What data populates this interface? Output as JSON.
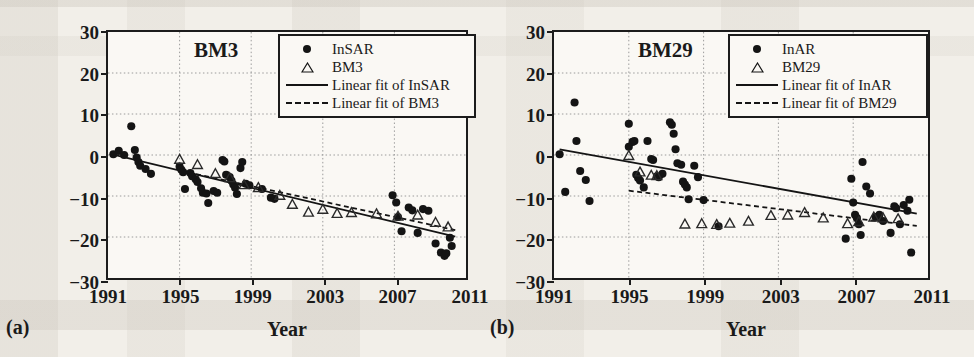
{
  "figure": {
    "background_color": "#f2efe9",
    "plot_background_color": "#faf8f4",
    "ink_color": "#1a1a1a",
    "grid_color": "#9a9a9a"
  },
  "panels": [
    {
      "tag": "(a)",
      "title": "BM3",
      "xlabel": "Year",
      "ylabel": "Deformation (mm)",
      "legend": [
        {
          "key": "circle",
          "label": "InSAR"
        },
        {
          "key": "triangle",
          "label": "BM3"
        },
        {
          "key": "solid-line",
          "label": "Linear fit of InSAR"
        },
        {
          "key": "dashed-line",
          "label": "Linear fit of BM3"
        }
      ]
    },
    {
      "tag": "(b)",
      "title": "BM29",
      "xlabel": "Year",
      "ylabel": "Deformation (mm)",
      "legend": [
        {
          "key": "circle",
          "label": "InAR"
        },
        {
          "key": "triangle",
          "label": "BM29"
        },
        {
          "key": "solid-line",
          "label": "Linear fit of InAR"
        },
        {
          "key": "dashed-line",
          "label": "Linear fit of BM29"
        }
      ]
    }
  ],
  "chart_data": [
    {
      "type": "scatter",
      "panel": "(a)",
      "title": "BM3",
      "xlabel": "Year",
      "ylabel": "Deformation (mm)",
      "xlim": [
        1991,
        2011
      ],
      "ylim": [
        -30,
        30
      ],
      "xticks": [
        1991,
        1995,
        1999,
        2003,
        2007,
        2011
      ],
      "yticks": [
        30,
        20,
        10,
        0,
        -10,
        -20,
        -30
      ],
      "grid": true,
      "grid_style": "dotted",
      "legend_position": "top-right",
      "series": [
        {
          "name": "InSAR",
          "marker": "filled-circle",
          "points": [
            [
              1991.3,
              0.2
            ],
            [
              1991.6,
              1.0
            ],
            [
              1991.9,
              0.0
            ],
            [
              1992.3,
              7.0
            ],
            [
              1992.5,
              1.2
            ],
            [
              1992.6,
              -0.6
            ],
            [
              1992.7,
              -1.7
            ],
            [
              1992.8,
              -2.6
            ],
            [
              1993.1,
              -3.4
            ],
            [
              1993.4,
              -4.6
            ],
            [
              1995.0,
              -2.8
            ],
            [
              1995.1,
              -3.6
            ],
            [
              1995.2,
              -4.2
            ],
            [
              1995.3,
              -8.3
            ],
            [
              1995.6,
              -4.4
            ],
            [
              1995.7,
              -5.2
            ],
            [
              1995.9,
              -5.9
            ],
            [
              1996.0,
              -6.6
            ],
            [
              1996.2,
              -8.1
            ],
            [
              1996.3,
              -9.2
            ],
            [
              1996.5,
              -9.4
            ],
            [
              1996.6,
              -11.7
            ],
            [
              1996.9,
              -8.8
            ],
            [
              1997.1,
              -9.2
            ],
            [
              1997.4,
              -1.2
            ],
            [
              1997.5,
              -1.6
            ],
            [
              1997.6,
              -4.8
            ],
            [
              1997.8,
              -5.4
            ],
            [
              1997.9,
              -6.3
            ],
            [
              1998.0,
              -7.2
            ],
            [
              1998.1,
              -8.0
            ],
            [
              1998.2,
              -9.5
            ],
            [
              1998.4,
              -3.2
            ],
            [
              1998.5,
              -1.7
            ],
            [
              1998.7,
              -7.0
            ],
            [
              1998.9,
              -7.4
            ],
            [
              1999.6,
              -8.3
            ],
            [
              2000.1,
              -10.4
            ],
            [
              2000.3,
              -10.7
            ],
            [
              2006.9,
              -9.8
            ],
            [
              2007.1,
              -11.6
            ],
            [
              2007.2,
              -15.1
            ],
            [
              2007.4,
              -18.6
            ],
            [
              2007.8,
              -12.8
            ],
            [
              2008.0,
              -13.5
            ],
            [
              2008.3,
              -19.0
            ],
            [
              2008.6,
              -13.2
            ],
            [
              2008.9,
              -13.6
            ],
            [
              2009.3,
              -21.6
            ],
            [
              2009.6,
              -23.8
            ],
            [
              2009.8,
              -24.6
            ],
            [
              2009.9,
              -24.0
            ],
            [
              2010.1,
              -20.2
            ],
            [
              2010.2,
              -22.2
            ]
          ]
        },
        {
          "name": "BM3",
          "marker": "open-triangle",
          "points": [
            [
              1995.0,
              -1.1
            ],
            [
              1996.0,
              -2.4
            ],
            [
              1997.0,
              -4.6
            ],
            [
              1997.8,
              -5.6
            ],
            [
              1998.6,
              -7.3
            ],
            [
              1999.4,
              -8.0
            ],
            [
              2000.6,
              -9.9
            ],
            [
              2001.3,
              -12.1
            ],
            [
              2002.2,
              -14.0
            ],
            [
              2003.0,
              -13.3
            ],
            [
              2003.8,
              -14.3
            ],
            [
              2004.6,
              -14.1
            ],
            [
              2006.0,
              -14.4
            ],
            [
              2007.2,
              -15.0
            ],
            [
              2008.3,
              -14.7
            ],
            [
              2009.3,
              -16.5
            ],
            [
              2010.0,
              -17.6
            ]
          ]
        }
      ],
      "fits": [
        {
          "name": "Linear fit of InSAR",
          "style": "solid",
          "x": [
            1991.3,
            2010.4
          ],
          "y": [
            0.1,
            -19.9
          ]
        },
        {
          "name": "Linear fit of BM3",
          "style": "dashed",
          "x": [
            1995.0,
            2010.4
          ],
          "y": [
            -3.8,
            -18.3
          ]
        }
      ]
    },
    {
      "type": "scatter",
      "panel": "(b)",
      "title": "BM29",
      "xlabel": "Year",
      "ylabel": "Deformation (mm)",
      "xlim": [
        1991,
        2011
      ],
      "ylim": [
        -30,
        30
      ],
      "xticks": [
        1991,
        1995,
        1999,
        2003,
        2007,
        2011
      ],
      "yticks": [
        30,
        20,
        10,
        0,
        -10,
        -20,
        -30
      ],
      "grid": true,
      "grid_style": "dotted",
      "legend_position": "top-right",
      "series": [
        {
          "name": "InAR",
          "marker": "filled-circle",
          "points": [
            [
              1991.3,
              0.2
            ],
            [
              1991.6,
              -9.0
            ],
            [
              1992.1,
              12.8
            ],
            [
              1992.2,
              3.4
            ],
            [
              1992.4,
              -3.9
            ],
            [
              1992.7,
              -6.1
            ],
            [
              1992.9,
              -11.2
            ],
            [
              1995.0,
              7.6
            ],
            [
              1995.0,
              2.0
            ],
            [
              1995.2,
              3.2
            ],
            [
              1995.3,
              3.4
            ],
            [
              1995.4,
              -4.8
            ],
            [
              1995.5,
              -5.6
            ],
            [
              1995.6,
              -6.2
            ],
            [
              1995.8,
              -7.9
            ],
            [
              1996.0,
              3.4
            ],
            [
              1996.2,
              -1.0
            ],
            [
              1996.3,
              -1.2
            ],
            [
              1996.5,
              -5.2
            ],
            [
              1996.6,
              -5.4
            ],
            [
              1996.8,
              -4.6
            ],
            [
              1997.2,
              8.0
            ],
            [
              1997.3,
              7.4
            ],
            [
              1997.4,
              5.2
            ],
            [
              1997.5,
              1.4
            ],
            [
              1997.6,
              -2.0
            ],
            [
              1997.8,
              -2.4
            ],
            [
              1997.9,
              -6.5
            ],
            [
              1998.0,
              -7.2
            ],
            [
              1998.1,
              -7.9
            ],
            [
              1998.2,
              -10.8
            ],
            [
              1998.5,
              -2.6
            ],
            [
              1998.7,
              -5.4
            ],
            [
              1999.0,
              -11.0
            ],
            [
              1999.8,
              -17.4
            ],
            [
              2006.6,
              -20.4
            ],
            [
              2006.9,
              -5.8
            ],
            [
              2007.0,
              -11.6
            ],
            [
              2007.1,
              -14.6
            ],
            [
              2007.2,
              -15.4
            ],
            [
              2007.3,
              -16.9
            ],
            [
              2007.4,
              -19.5
            ],
            [
              2007.5,
              -1.7
            ],
            [
              2007.7,
              -7.7
            ],
            [
              2007.9,
              -9.4
            ],
            [
              2008.2,
              -15.1
            ],
            [
              2008.4,
              -14.6
            ],
            [
              2008.6,
              -16.1
            ],
            [
              2009.0,
              -19.0
            ],
            [
              2009.2,
              -12.5
            ],
            [
              2009.3,
              -13.0
            ],
            [
              2009.5,
              -16.9
            ],
            [
              2009.7,
              -12.2
            ],
            [
              2009.9,
              -13.6
            ],
            [
              2010.0,
              -10.9
            ],
            [
              2010.1,
              -23.8
            ]
          ]
        },
        {
          "name": "BM29",
          "marker": "open-triangle",
          "points": [
            [
              1995.0,
              -0.2
            ],
            [
              1995.6,
              -4.2
            ],
            [
              1996.2,
              -5.0
            ],
            [
              1996.5,
              -5.1
            ],
            [
              1998.0,
              -16.9
            ],
            [
              1998.9,
              -16.8
            ],
            [
              1999.7,
              -17.0
            ],
            [
              2000.4,
              -16.7
            ],
            [
              2001.4,
              -16.2
            ],
            [
              2002.6,
              -14.8
            ],
            [
              2003.5,
              -14.7
            ],
            [
              2004.4,
              -14.1
            ],
            [
              2005.4,
              -15.4
            ],
            [
              2006.7,
              -16.8
            ],
            [
              2007.3,
              -16.3
            ],
            [
              2008.1,
              -15.2
            ],
            [
              2008.6,
              -15.4
            ],
            [
              2009.4,
              -15.6
            ]
          ]
        }
      ],
      "fits": [
        {
          "name": "Linear fit of InAR",
          "style": "solid",
          "x": [
            1991.3,
            2010.4
          ],
          "y": [
            1.4,
            -14.3
          ]
        },
        {
          "name": "Linear fit of BM29",
          "style": "dashed",
          "x": [
            1995.0,
            2010.4
          ],
          "y": [
            -8.7,
            -17.3
          ]
        }
      ]
    }
  ]
}
